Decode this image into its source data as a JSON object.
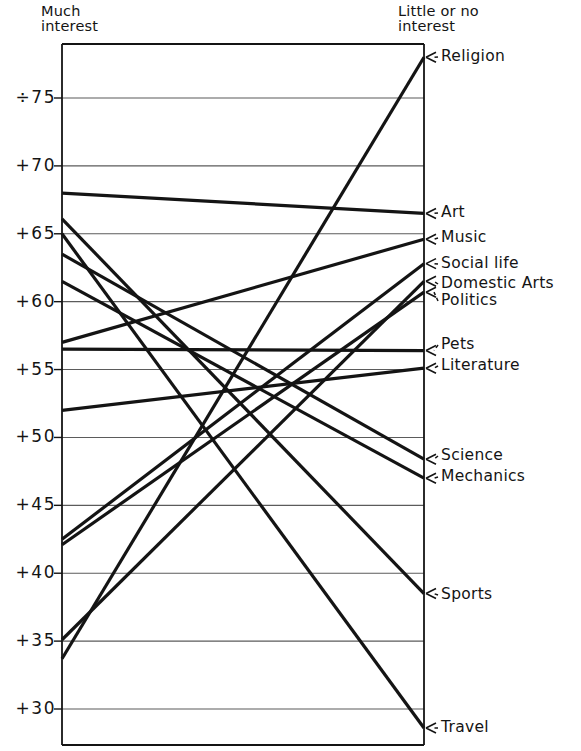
{
  "header": {
    "left_title_line1": "Much",
    "left_title_line2": "interest",
    "right_title_line1": "Little or no",
    "right_title_line2": "interest"
  },
  "chart_data": {
    "type": "line",
    "title": "",
    "subtitle": "",
    "xlabel": "",
    "ylabel": "",
    "x": [
      "Much interest",
      "Little or no interest"
    ],
    "ylim": [
      28,
      79
    ],
    "yticks": [
      30,
      35,
      40,
      45,
      50,
      55,
      60,
      65,
      70,
      75
    ],
    "ytick_labels": [
      "+30",
      "+35",
      "+40",
      "+45",
      "+50",
      "+55",
      "+60",
      "+65",
      "+70",
      "÷75"
    ],
    "grid": true,
    "legend": "right-annotations",
    "series": [
      {
        "name": "Religion",
        "values": [
          33.7,
          78.0
        ],
        "label_side": "right"
      },
      {
        "name": "Art",
        "values": [
          68.0,
          66.5
        ],
        "label_side": "right"
      },
      {
        "name": "Music",
        "values": [
          57.0,
          64.6
        ],
        "label_side": "right"
      },
      {
        "name": "Social life",
        "values": [
          42.5,
          62.8
        ],
        "label_side": "right"
      },
      {
        "name": "Domestic Arts",
        "values": [
          35.1,
          61.5
        ],
        "label_side": "right"
      },
      {
        "name": "Politics",
        "values": [
          42.1,
          60.7
        ],
        "label_side": "right"
      },
      {
        "name": "Pets",
        "values": [
          56.5,
          56.4
        ],
        "label_side": "right"
      },
      {
        "name": "Literature",
        "values": [
          52.0,
          55.1
        ],
        "label_side": "right"
      },
      {
        "name": "Science",
        "values": [
          63.5,
          48.4
        ],
        "label_side": "right"
      },
      {
        "name": "Mechanics",
        "values": [
          61.5,
          47.0
        ],
        "label_side": "right"
      },
      {
        "name": "Sports",
        "values": [
          66.1,
          38.5
        ],
        "label_side": "right"
      },
      {
        "name": "Travel",
        "values": [
          65.0,
          28.6
        ],
        "label_side": "right"
      }
    ]
  },
  "right_labels": [
    {
      "text": "Religion"
    },
    {
      "text": "Art"
    },
    {
      "text": "Music"
    },
    {
      "text": "Social life"
    },
    {
      "text": "Domestic  Arts"
    },
    {
      "text": "Politics"
    },
    {
      "text": "Pets"
    },
    {
      "text": "Literature"
    },
    {
      "text": "Science"
    },
    {
      "text": "Mechanics"
    },
    {
      "text": "Sports"
    },
    {
      "text": "Travel"
    }
  ],
  "axis": {
    "tick_75": "÷75",
    "tick_70": "+70",
    "tick_65": "+65",
    "tick_60": "+60",
    "tick_55": "+55",
    "tick_50": "+50",
    "tick_45": "+45",
    "tick_40": "+40",
    "tick_35": "+35",
    "tick_30": "+30"
  },
  "colors": {
    "ink": "#141414",
    "grid": "#5b5b5b",
    "frame": "#141414",
    "paper": "#ffffff"
  }
}
